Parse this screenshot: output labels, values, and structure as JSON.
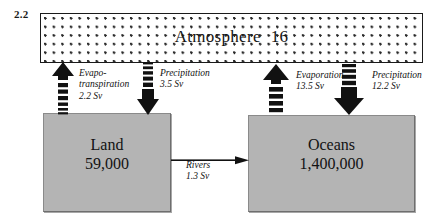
{
  "diagram": {
    "title_hint": "Global hydrological cycle reservoirs and fluxes",
    "corner_label": "2.2",
    "units": "Sv"
  },
  "reservoirs": [
    {
      "id": "atmosphere",
      "name": "Atmosphere",
      "amount": "16",
      "fill": "#ffffff",
      "pattern": "dotted"
    },
    {
      "id": "land",
      "name": "Land",
      "amount": "59,000",
      "fill": "#b4b4b4",
      "pattern": "solid"
    },
    {
      "id": "oceans",
      "name": "Oceans",
      "amount": "1,400,000",
      "fill": "#b4b4b4",
      "pattern": "solid"
    }
  ],
  "fluxes": [
    {
      "id": "evapotranspiration",
      "name_line1": "Evapo-",
      "name_line2": "transpiration",
      "value": "2.2 Sv",
      "direction": "up",
      "from": "land",
      "to": "atmosphere"
    },
    {
      "id": "precipitation-land",
      "name_line1": "Precipitation",
      "name_line2": "",
      "value": "3.5 Sv",
      "direction": "down",
      "from": "atmosphere",
      "to": "land"
    },
    {
      "id": "evaporation-ocean",
      "name_line1": "Evaporation",
      "name_line2": "",
      "value": "13.5 Sv",
      "direction": "up",
      "from": "oceans",
      "to": "atmosphere"
    },
    {
      "id": "precipitation-ocean",
      "name_line1": "Precipitation",
      "name_line2": "",
      "value": "12.2 Sv",
      "direction": "down",
      "from": "atmosphere",
      "to": "oceans"
    },
    {
      "id": "rivers",
      "name_line1": "Rivers",
      "name_line2": "",
      "value": "1.3 Sv",
      "direction": "right",
      "from": "land",
      "to": "oceans"
    }
  ],
  "colors": {
    "ink": "#121212",
    "reservoir_fill": "#b4b4b4",
    "reservoir_stroke": "#6e6e6e",
    "atmosphere_stroke": "#1a1a1a"
  }
}
